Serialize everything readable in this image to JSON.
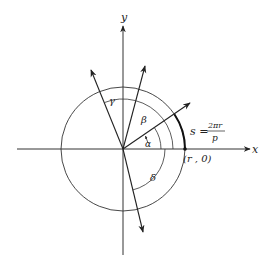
{
  "figure": {
    "type": "unit-circle-angle-diagram",
    "axes": {
      "x_label": "x",
      "y_label": "y"
    },
    "point_label": "(r , 0)",
    "arc_length_formula": {
      "lhs": "s =",
      "numerator": "2πr",
      "denominator": "p"
    },
    "angle_labels": {
      "alpha": "α",
      "beta": "β",
      "gamma": "γ",
      "delta": "δ"
    },
    "geometry": {
      "origin": [
        123,
        149
      ],
      "circle_radius": 62,
      "ray_angles_deg": {
        "alpha": 34,
        "beta": 76,
        "gamma": 112,
        "delta": -77
      },
      "arc_radii": {
        "alpha": 38,
        "beta": 50,
        "gamma": 50,
        "delta": 42
      }
    },
    "colors": {
      "stroke": "#222222",
      "background": "#ffffff"
    }
  }
}
